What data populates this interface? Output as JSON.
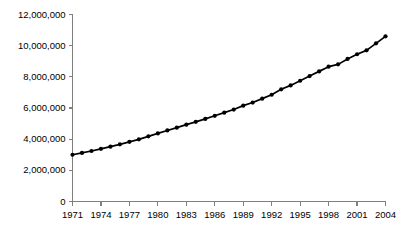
{
  "chart_data": {
    "type": "line",
    "title": "",
    "subtitle": "",
    "xlabel": "",
    "ylabel": "",
    "grid": false,
    "legend": false,
    "legend_position": "none",
    "marker": "filled-circle",
    "line_color": "#000000",
    "marker_color": "#000000",
    "axis_color": "#808080",
    "background_color": "#ffffff",
    "xlim": [
      1971,
      2004
    ],
    "ylim": [
      0,
      12000000
    ],
    "ytick_values": [
      0,
      2000000,
      4000000,
      6000000,
      8000000,
      10000000,
      12000000
    ],
    "ytick_labels": [
      "0",
      "2,000,000",
      "4,000,000",
      "6,000,000",
      "8,000,000",
      "10,000,000",
      "12,000,000"
    ],
    "xtick_values": [
      1971,
      1974,
      1977,
      1980,
      1983,
      1986,
      1989,
      1992,
      1995,
      1998,
      2001,
      2004
    ],
    "xtick_labels": [
      "1971",
      "1974",
      "1977",
      "1980",
      "1983",
      "1986",
      "1989",
      "1992",
      "1995",
      "1998",
      "2001",
      "2004"
    ],
    "x": [
      1971,
      1972,
      1973,
      1974,
      1975,
      1976,
      1977,
      1978,
      1979,
      1980,
      1981,
      1982,
      1983,
      1984,
      1985,
      1986,
      1987,
      1988,
      1989,
      1990,
      1991,
      1992,
      1993,
      1994,
      1995,
      1996,
      1997,
      1998,
      1999,
      2000,
      2001,
      2002,
      2003,
      2004
    ],
    "values": [
      3000000,
      3120000,
      3240000,
      3380000,
      3520000,
      3670000,
      3830000,
      3990000,
      4180000,
      4370000,
      4560000,
      4740000,
      4930000,
      5110000,
      5300000,
      5500000,
      5700000,
      5900000,
      6150000,
      6350000,
      6600000,
      6850000,
      7200000,
      7450000,
      7750000,
      8050000,
      8350000,
      8650000,
      8800000,
      9150000,
      9450000,
      9700000,
      10150000,
      10600000
    ],
    "series": [
      {
        "name": "",
        "values": [
          3000000,
          3120000,
          3240000,
          3380000,
          3520000,
          3670000,
          3830000,
          3990000,
          4180000,
          4370000,
          4560000,
          4740000,
          4930000,
          5110000,
          5300000,
          5500000,
          5700000,
          5900000,
          6150000,
          6350000,
          6600000,
          6850000,
          7200000,
          7450000,
          7750000,
          8050000,
          8350000,
          8650000,
          8800000,
          9150000,
          9450000,
          9700000,
          10150000,
          10600000
        ]
      }
    ]
  }
}
